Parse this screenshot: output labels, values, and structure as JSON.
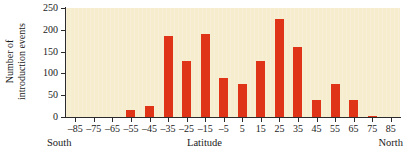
{
  "chart_data": {
    "type": "bar",
    "title": "",
    "xlabel": "Latitude",
    "ylabel": "Number of introduction events",
    "ylabel_line1": "Number of",
    "ylabel_line2": "introduction events",
    "categories": [
      "-85",
      "-75",
      "-65",
      "-55",
      "-45",
      "-35",
      "-25",
      "-15",
      "-5",
      "5",
      "15",
      "25",
      "35",
      "45",
      "55",
      "65",
      "75",
      "85"
    ],
    "values": [
      0,
      0,
      0,
      15,
      25,
      185,
      128,
      190,
      90,
      75,
      129,
      225,
      160,
      40,
      75,
      40,
      3,
      0
    ],
    "xticks": [
      "-85",
      "-75",
      "-65",
      "-55",
      "-45",
      "-35",
      "-25",
      "-15",
      "-5",
      "5",
      "15",
      "25",
      "35",
      "45",
      "55",
      "65",
      "75",
      "85"
    ],
    "yticks": [
      "0",
      "50",
      "100",
      "150",
      "200",
      "250"
    ],
    "ytick_values": [
      0,
      50,
      100,
      150,
      200,
      250
    ],
    "ylim": [
      0,
      250
    ],
    "xlim": [
      -90,
      90
    ],
    "grid": false,
    "legend": null,
    "bar_color": "#e03418",
    "plot_background": "#f6ecce",
    "axis_color": "#2b2b2b"
  },
  "captions": {
    "south": "South",
    "north": "North",
    "x_center": "Latitude"
  }
}
